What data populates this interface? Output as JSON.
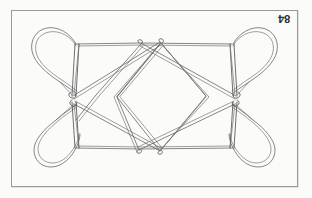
{
  "page": {
    "background_color": "#fbfbfa",
    "width": 312,
    "height": 198
  },
  "plate": {
    "number_label": "84",
    "number_rotated_180": true,
    "frame_color": "#9a9a9a",
    "ink_color": "#5d5d5d"
  },
  "figure": {
    "title": "",
    "caption": ""
  }
}
